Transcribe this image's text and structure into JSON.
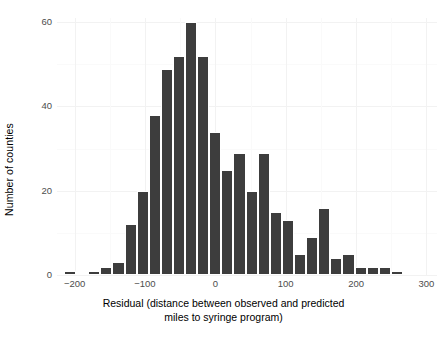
{
  "chart_data": {
    "type": "bar",
    "title": "",
    "subtitle": "",
    "xlabel": "Residual (distance between observed and predicted miles to syringe program)",
    "xlabel_lines": [
      "Residual (distance between observed and predicted",
      "miles to syringe program)"
    ],
    "ylabel": "Number of counties",
    "xlim": [
      -225,
      315
    ],
    "ylim": [
      0,
      61
    ],
    "xticks": [
      -200,
      -100,
      0,
      100,
      200,
      300
    ],
    "xtick_labels": [
      "−200",
      "−100",
      "0",
      "100",
      "200",
      "300"
    ],
    "yticks": [
      0,
      20,
      40,
      60
    ],
    "ytick_labels": [
      "0",
      "20",
      "40",
      "60"
    ],
    "grid": true,
    "legend": "none",
    "bar_color": "#3d3d3d",
    "panel_color": "#ffffff",
    "grid_color": "#f2f2f2",
    "bin_width": 17.2,
    "bin_starts": [
      -215.0,
      -197.8,
      -180.6,
      -163.4,
      -146.2,
      -129.0,
      -111.8,
      -94.6,
      -77.4,
      -60.2,
      -43.0,
      -25.8,
      -8.6,
      8.6,
      25.8,
      43.0,
      60.2,
      77.4,
      94.6,
      111.8,
      129.0,
      146.2,
      163.4,
      180.6,
      197.8,
      215.0,
      232.2,
      249.4,
      266.6,
      283.8
    ],
    "bin_centers": [
      -206.4,
      -189.2,
      -172.0,
      -154.8,
      -137.6,
      -120.4,
      -103.2,
      -86.0,
      -68.8,
      -51.6,
      -34.4,
      -17.2,
      0.0,
      17.2,
      34.4,
      51.6,
      68.8,
      86.0,
      103.2,
      120.4,
      137.6,
      154.8,
      172.0,
      189.2,
      206.4,
      223.6,
      240.8,
      258.0,
      275.2,
      292.4
    ],
    "values": [
      1,
      0,
      1,
      2,
      3,
      12,
      20,
      38,
      49,
      52,
      60,
      52,
      34,
      25,
      29,
      20,
      29,
      15,
      13,
      5,
      9,
      16,
      4,
      5,
      2,
      2,
      2,
      1,
      0,
      0
    ],
    "categories": [
      "-206",
      "-189",
      "-172",
      "-155",
      "-138",
      "-120",
      "-103",
      "-86",
      "-69",
      "-52",
      "-34",
      "-17",
      "0",
      "17",
      "34",
      "52",
      "69",
      "86",
      "103",
      "120",
      "138",
      "155",
      "172",
      "189",
      "206",
      "224",
      "241",
      "258",
      "275",
      "292"
    ]
  }
}
